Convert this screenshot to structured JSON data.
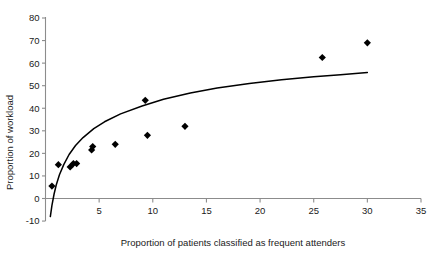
{
  "chart_data": {
    "type": "scatter",
    "title": "",
    "xlabel": "Proportion of patients classified as frequent attenders",
    "ylabel": "Proportion of workload",
    "xlim": [
      -0.6,
      35
    ],
    "ylim": [
      -10,
      80
    ],
    "xticks": [
      5,
      10,
      15,
      20,
      25,
      30,
      35
    ],
    "yticks": [
      -10,
      0,
      10,
      20,
      30,
      40,
      50,
      60,
      70,
      80
    ],
    "xtick_labels": [
      "5",
      "10",
      "15",
      "20",
      "25",
      "30",
      "35"
    ],
    "ytick_labels": [
      "-10",
      "0",
      "10",
      "20",
      "30",
      "40",
      "50",
      "60",
      "70",
      "80"
    ],
    "grid": false,
    "legend": null,
    "marker": "diamond",
    "marker_color": "#000000",
    "points": [
      {
        "x": 0.6,
        "y": 5.5
      },
      {
        "x": 1.2,
        "y": 15.0
      },
      {
        "x": 2.3,
        "y": 14.0
      },
      {
        "x": 2.6,
        "y": 15.5
      },
      {
        "x": 2.9,
        "y": 15.5
      },
      {
        "x": 4.3,
        "y": 21.5
      },
      {
        "x": 4.4,
        "y": 23.0
      },
      {
        "x": 6.5,
        "y": 24.0
      },
      {
        "x": 9.3,
        "y": 43.5
      },
      {
        "x": 9.5,
        "y": 28.0
      },
      {
        "x": 13.0,
        "y": 32.0
      },
      {
        "x": 25.8,
        "y": 62.5
      },
      {
        "x": 30.0,
        "y": 69.0
      }
    ],
    "series": [
      {
        "name": "fitted-logarithmic-curve",
        "type": "line",
        "color": "#000000",
        "x": [
          0.45,
          0.6,
          0.8,
          1.0,
          1.3,
          1.7,
          2.2,
          2.8,
          3.5,
          4.5,
          5.5,
          7.0,
          9.0,
          11.0,
          13.5,
          16.0,
          19.0,
          22.0,
          25.0,
          27.5,
          30.0
        ],
        "y": [
          -8.0,
          -3.0,
          2.0,
          6.0,
          10.5,
          15.0,
          19.5,
          23.5,
          27.0,
          31.0,
          34.0,
          37.5,
          41.0,
          44.0,
          46.8,
          49.0,
          51.0,
          52.6,
          54.0,
          54.9,
          55.8
        ]
      }
    ]
  },
  "axes": {
    "x_title": "Proportion of patients classified as frequent attenders",
    "y_title": "Proportion of workload"
  }
}
